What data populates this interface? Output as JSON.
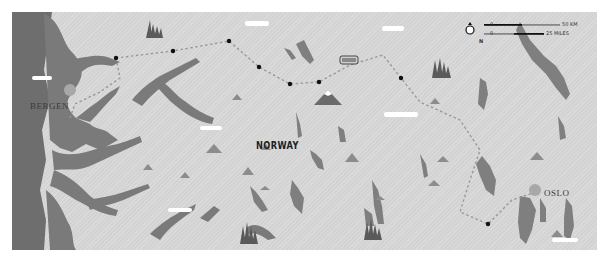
{
  "map": {
    "title": "Norway route map",
    "country_label": "NORWAY",
    "cities": [
      {
        "name": "BERGEN",
        "x": 18,
        "y": 87
      },
      {
        "name": "OSLO",
        "x": 532,
        "y": 188
      }
    ],
    "scale": {
      "north_icon": "N",
      "km_start": "0",
      "km_end": "50 KM",
      "miles_start": "0",
      "miles_end": "25 MILES"
    },
    "route_stops": [
      [
        116,
        58
      ],
      [
        173,
        51
      ],
      [
        229,
        41
      ],
      [
        259,
        67
      ],
      [
        290,
        84
      ],
      [
        319,
        82
      ],
      [
        401,
        78
      ],
      [
        488,
        224
      ]
    ],
    "colors": {
      "land": "#d3d3d3",
      "water": "#7a7a7a",
      "sea": "#6e6e6e",
      "route": "#999999",
      "stop": "#111111",
      "mountain": "#8c8c8c",
      "cloud": "#ffffff",
      "city_marker": "#a8a8a8"
    }
  }
}
